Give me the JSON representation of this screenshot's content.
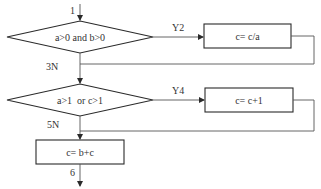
{
  "flowchart": {
    "decisions": [
      {
        "id": "d1",
        "condition": "a>0 and b>0"
      },
      {
        "id": "d2",
        "condition": "a>1  or c>1"
      }
    ],
    "processes": [
      {
        "id": "p1",
        "statement": "c= c/a"
      },
      {
        "id": "p2",
        "statement": "c= c+1"
      },
      {
        "id": "p3",
        "statement": "c= b+c"
      }
    ],
    "edge_labels": {
      "entry": "1",
      "d1_yes": "Y2",
      "d1_no": "3N",
      "d2_yes": "Y4",
      "d2_no": "5N",
      "exit": "6"
    },
    "colors": {
      "stroke": "#2a2a2a",
      "connector": "#555555",
      "text": "#333333",
      "background": "#ffffff"
    }
  }
}
